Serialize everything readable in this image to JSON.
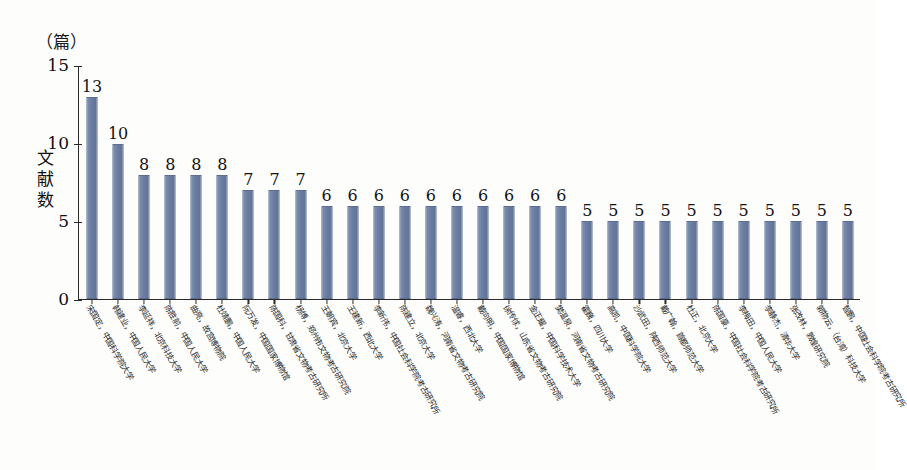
{
  "figure": {
    "unit_label": "（篇）",
    "y_axis_title": [
      "文",
      "献",
      "数"
    ],
    "bar_color": "#6c7fa3",
    "axis_color": "#2a2a2a",
    "background": "#fdfdfc"
  },
  "chart_data": {
    "type": "bar",
    "title": "",
    "subtitle": "",
    "xlabel": "",
    "ylabel": "文献数",
    "unit": "篇",
    "ylim": [
      0,
      15
    ],
    "yticks": [
      0,
      5,
      10,
      15
    ],
    "grid": false,
    "legend": false,
    "legend_position": "none",
    "value_labels": true,
    "orientation": "vertical",
    "categories": [
      "宋国定，中国科学院大学",
      "韩建业，中国人民大学",
      "李延祥，北京科技大学",
      "陈胜前，中国人民大学",
      "曲亮，故宫博物院",
      "杜靖鹏，中国人民大学",
      "阮万发，中国国家博物馆",
      "陈国科，甘肃省文物考古研究所",
      "杨博，郑州市文物考古研究院",
      "王朝宾，北京大学",
      "王建新，西北大学",
      "李新伟，中国社会科学院考古研究所",
      "陈建立，北京大学",
      "魏兴涛，河南省文物考古研究院",
      "温睿，西北大学",
      "戴向明，中国国家博物馆",
      "徐传俅，山东省文物考古研究院",
      "金正耀，中国科学技术大学",
      "樊温泉，河南省文物考古研究院",
      "霍巍，四川大学",
      "高凯，中国科学院大学",
      "沙武田，陕西师范大学",
      "戴广翰，首都师范大学",
      "杜正，北京大学",
      "陈国豪，中国社会科学院考古研究所",
      "李梅田，中国人民大学",
      "李静杰，清华大学",
      "张改林，敦煌研究院",
      "郭物云，（台湾）科技大学",
      "智鹏，中国社会科学院考古研究所"
    ],
    "values": [
      13,
      10,
      8,
      8,
      8,
      8,
      7,
      7,
      7,
      6,
      6,
      6,
      6,
      6,
      6,
      6,
      6,
      6,
      6,
      5,
      5,
      5,
      5,
      5,
      5,
      5,
      5,
      5,
      5,
      5
    ]
  }
}
